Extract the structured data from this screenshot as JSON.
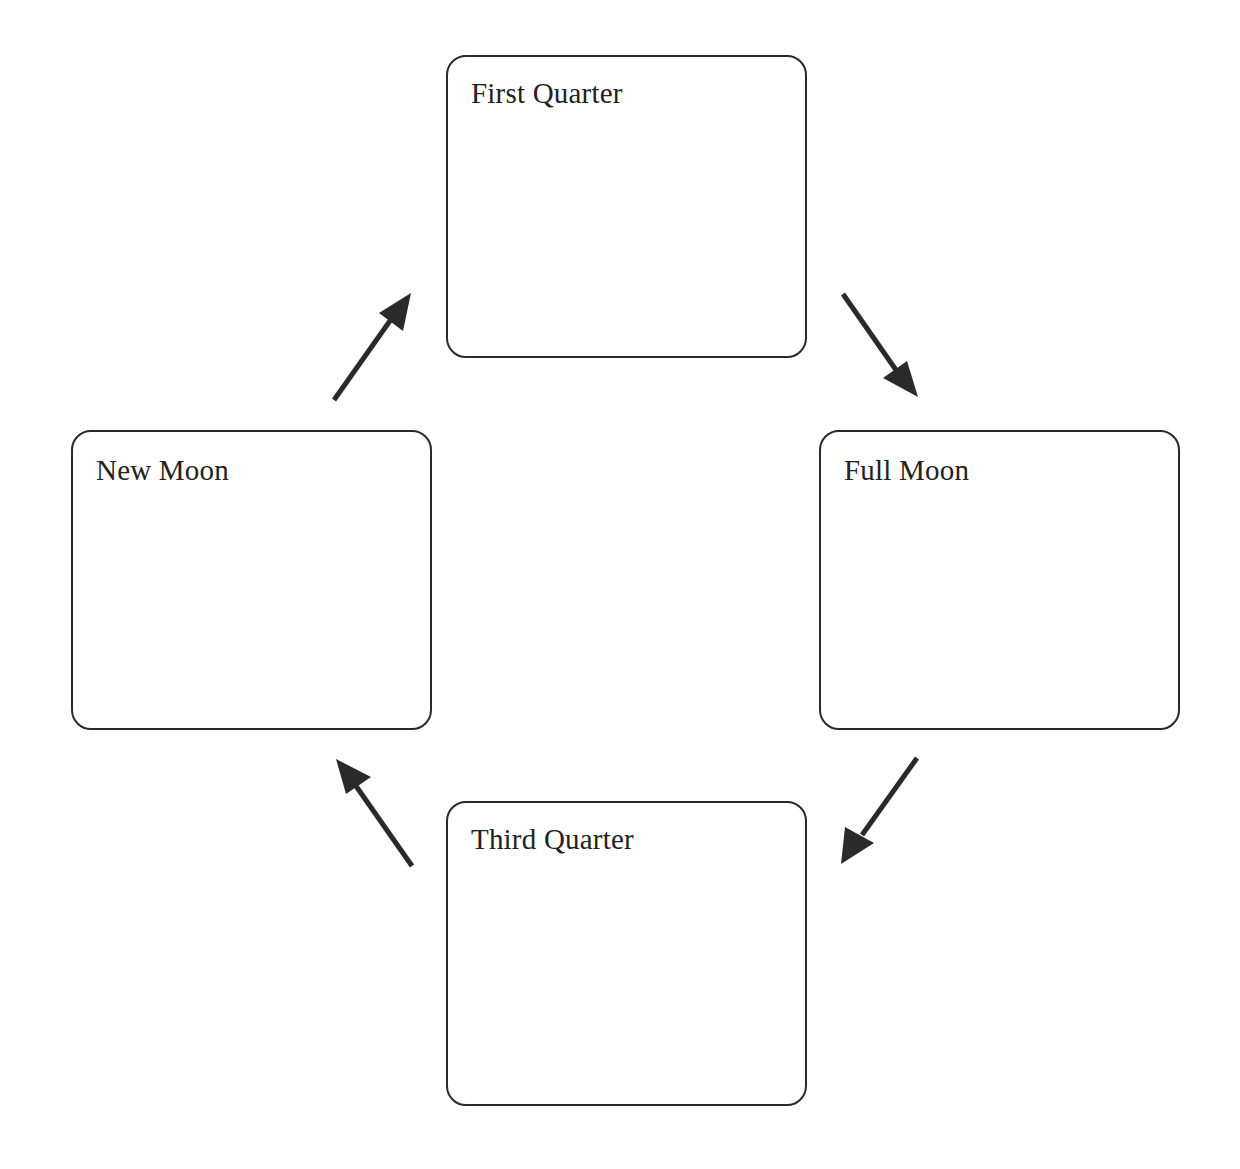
{
  "diagram": {
    "type": "cycle",
    "title": "",
    "phases": [
      {
        "id": "first",
        "label": "First Quarter"
      },
      {
        "id": "full",
        "label": "Full Moon"
      },
      {
        "id": "third",
        "label": "Third Quarter"
      },
      {
        "id": "new",
        "label": "New Moon"
      }
    ],
    "arrows": [
      {
        "from": "New Moon",
        "to": "First Quarter"
      },
      {
        "from": "First Quarter",
        "to": "Full Moon"
      },
      {
        "from": "Full Moon",
        "to": "Third Quarter"
      },
      {
        "from": "Third Quarter",
        "to": "New Moon"
      }
    ],
    "colors": {
      "stroke": "#2a2a2a",
      "text": "#222222",
      "background": "#ffffff"
    }
  }
}
